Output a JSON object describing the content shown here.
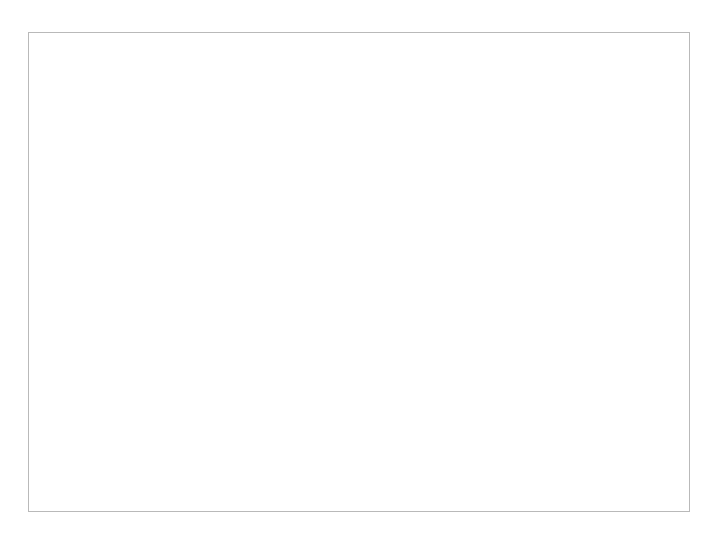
{
  "chart_data": {
    "type": "line",
    "title": "50% Standard Deviation",
    "xlabel": "",
    "ylabel": "",
    "xlim": [
      0,
      17000
    ],
    "ylim": [
      0.8,
      2.2
    ],
    "grid": false,
    "legend_position": "inside-upper-right",
    "xticks": [
      0,
      2000,
      4000,
      6000,
      8000,
      10000,
      12000,
      14000,
      16000
    ],
    "xtick_labels": [
      "0",
      "2000",
      "4000",
      "6000",
      "8000",
      "10000",
      "12000",
      "14000",
      "16000"
    ],
    "yticks": [
      0.8,
      1,
      1.2,
      1.4,
      1.6,
      1.8,
      2,
      2.2
    ],
    "ytick_labels": [
      "0.8",
      "1",
      "1.2",
      "1.4",
      "1.6",
      "1.8",
      "2",
      "2.2"
    ],
    "series": [
      {
        "name": "Without Variance",
        "style": "solid-thin",
        "color": "#4c4c4c",
        "description": "Sawtooth: vertical rise from 1.0 to 2.0 at each doubling point, then exponential decay back to 1.0",
        "points": [
          [
            1000,
            1.0
          ],
          [
            1000,
            2.0
          ],
          [
            1100,
            1.82
          ],
          [
            1200,
            1.66
          ],
          [
            1300,
            1.52
          ],
          [
            1450,
            1.36
          ],
          [
            1600,
            1.24
          ],
          [
            1800,
            1.13
          ],
          [
            2000,
            1.03
          ],
          [
            2050,
            1.0
          ],
          [
            2050,
            2.0
          ],
          [
            2250,
            1.83
          ],
          [
            2450,
            1.69
          ],
          [
            2700,
            1.55
          ],
          [
            3000,
            1.41
          ],
          [
            3300,
            1.31
          ],
          [
            3650,
            1.21
          ],
          [
            4000,
            1.12
          ],
          [
            4050,
            1.0
          ],
          [
            4050,
            2.0
          ],
          [
            4450,
            1.84
          ],
          [
            4900,
            1.7
          ],
          [
            5400,
            1.58
          ],
          [
            6000,
            1.45
          ],
          [
            6600,
            1.34
          ],
          [
            7300,
            1.23
          ],
          [
            8000,
            1.13
          ],
          [
            8150,
            1.0
          ],
          [
            8150,
            2.0
          ],
          [
            8900,
            1.85
          ],
          [
            9800,
            1.72
          ],
          [
            10800,
            1.6
          ],
          [
            12000,
            1.46
          ],
          [
            13200,
            1.34
          ],
          [
            14600,
            1.21
          ],
          [
            16000,
            1.08
          ],
          [
            16350,
            1.01
          ],
          [
            16350,
            2.0
          ]
        ]
      },
      {
        "name": "Base with Variance",
        "style": "dashed",
        "color": "#111111",
        "description": "Near-flat upper trace around 2.06-2.10 with small saw steps at the doubling points",
        "points": [
          [
            1000,
            2.075
          ],
          [
            1100,
            2.062
          ],
          [
            1180,
            2.052
          ],
          [
            1200,
            2.098
          ],
          [
            1400,
            2.093
          ],
          [
            1600,
            2.086
          ],
          [
            1850,
            2.073
          ],
          [
            2030,
            2.062
          ],
          [
            2060,
            2.1
          ],
          [
            2400,
            2.097
          ],
          [
            2800,
            2.094
          ],
          [
            3300,
            2.089
          ],
          [
            3800,
            2.083
          ],
          [
            4030,
            2.079
          ],
          [
            4070,
            2.101
          ],
          [
            4600,
            2.098
          ],
          [
            5200,
            2.094
          ],
          [
            5900,
            2.088
          ],
          [
            6700,
            2.08
          ],
          [
            7500,
            2.072
          ],
          [
            8100,
            2.064
          ],
          [
            8200,
            2.092
          ],
          [
            9000,
            2.09
          ],
          [
            10000,
            2.086
          ],
          [
            10450,
            2.062
          ],
          [
            10550,
            2.098
          ],
          [
            11500,
            2.096
          ],
          [
            12500,
            2.094
          ],
          [
            13500,
            2.091
          ],
          [
            14500,
            2.087
          ],
          [
            15500,
            2.082
          ],
          [
            16350,
            2.077
          ]
        ]
      },
      {
        "name": "Simple Enhancement",
        "style": "solid-thick",
        "color": "#171717",
        "description": "Nearly flat line at about 1.45 with very small ripples",
        "points": [
          [
            1000,
            1.449
          ],
          [
            1200,
            1.452
          ],
          [
            1350,
            1.461
          ],
          [
            1500,
            1.455
          ],
          [
            1750,
            1.448
          ],
          [
            2000,
            1.45
          ],
          [
            2300,
            1.456
          ],
          [
            2600,
            1.461
          ],
          [
            2900,
            1.458
          ],
          [
            3400,
            1.451
          ],
          [
            4000,
            1.448
          ],
          [
            4600,
            1.45
          ],
          [
            5200,
            1.457
          ],
          [
            5800,
            1.462
          ],
          [
            6400,
            1.46
          ],
          [
            7200,
            1.456
          ],
          [
            8200,
            1.453
          ],
          [
            9200,
            1.455
          ],
          [
            10400,
            1.457
          ],
          [
            11600,
            1.456
          ],
          [
            13000,
            1.454
          ],
          [
            14500,
            1.453
          ],
          [
            16350,
            1.452
          ]
        ]
      },
      {
        "name": "Enhancement",
        "style": "dotted",
        "color": "#111111",
        "description": "Flat dotted line at about 1.34",
        "points": [
          [
            1000,
            1.338
          ],
          [
            3000,
            1.339
          ],
          [
            6000,
            1.34
          ],
          [
            10000,
            1.341
          ],
          [
            13000,
            1.341
          ],
          [
            16350,
            1.341
          ]
        ]
      }
    ],
    "legend": [
      {
        "label": "Without Variance",
        "style": "solid-thin"
      },
      {
        "label": "Base with Variance",
        "style": "dashed"
      },
      {
        "label": "Simple Enhancement",
        "style": "solid-thick"
      },
      {
        "label": "Enhancement",
        "style": "dotted"
      }
    ]
  }
}
